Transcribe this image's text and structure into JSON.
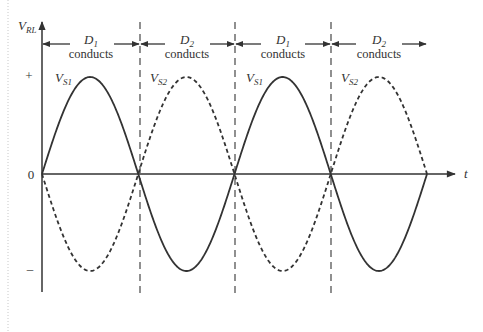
{
  "diagram": {
    "title": "",
    "y_axis_label": "V",
    "y_axis_label_sub": "RL",
    "x_axis_label": "t",
    "y_ticks": [
      {
        "label": "+",
        "y": 76
      },
      {
        "label": "0",
        "y": 174
      },
      {
        "label": "–",
        "y": 269
      }
    ],
    "intervals": [
      {
        "diode": "D",
        "sub": "1",
        "text": "conducts",
        "x1": 42,
        "x2": 140
      },
      {
        "diode": "D",
        "sub": "2",
        "text": "conducts",
        "x1": 140,
        "x2": 235
      },
      {
        "diode": "D",
        "sub": "1",
        "text": "conducts",
        "x1": 235,
        "x2": 331
      },
      {
        "diode": "D",
        "sub": "2",
        "text": "conducts",
        "x1": 331,
        "x2": 427
      }
    ],
    "curve_labels": [
      {
        "main": "V",
        "sub": "S1",
        "x": 55,
        "y": 82
      },
      {
        "main": "V",
        "sub": "S2",
        "x": 150,
        "y": 82
      },
      {
        "main": "V",
        "sub": "S1",
        "x": 246,
        "y": 82
      },
      {
        "main": "V",
        "sub": "S2",
        "x": 341,
        "y": 82
      }
    ],
    "series": [
      {
        "name": "V_S1",
        "style": "solid",
        "description": "sinusoid positive in D1 intervals"
      },
      {
        "name": "V_S2",
        "style": "dashed",
        "description": "sinusoid, inverted V_S1, positive in D2 intervals"
      }
    ],
    "colors": {
      "line": "#333333",
      "dashed_divider": "#555555",
      "left_border": "#c8c8c8"
    }
  }
}
